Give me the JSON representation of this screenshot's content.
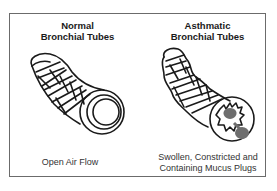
{
  "diagram": {
    "panels": [
      {
        "title_line1": "Normal",
        "title_line2": "Bronchial Tubes",
        "caption_line1": "Open Air Flow",
        "caption_line2": ""
      },
      {
        "title_line1": "Asthmatic",
        "title_line2": "Bronchial Tubes",
        "caption_line1": "Swollen, Constricted and",
        "caption_line2": "Containing Mucus Plugs"
      }
    ],
    "colors": {
      "line": "#1a1a1a",
      "mucus": "#6e6e6e",
      "border": "#6b6b6b"
    }
  }
}
